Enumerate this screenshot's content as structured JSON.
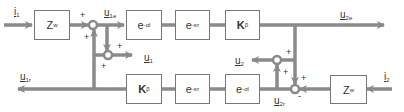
{
  "diagram": {
    "type": "block-diagram",
    "line_color": "#8a8a8a",
    "blocks": {
      "zw_top": {
        "base": "Z",
        "sub": "w"
      },
      "eal_top": {
        "base": "e",
        "sup": "-αl"
      },
      "est_top": {
        "base": "e",
        "sup": "-sτ"
      },
      "kb_top": {
        "base": "K",
        "sub": "β"
      },
      "kb_bot": {
        "base": "K",
        "sub": "β"
      },
      "est_bot": {
        "base": "e",
        "sup": "-sτ"
      },
      "eal_bot": {
        "base": "e",
        "sup": "-αl"
      },
      "zw_bot": {
        "base": "Z",
        "sub": "w"
      }
    },
    "signals": {
      "i1": {
        "base": "i",
        "sub": "1"
      },
      "u1e": {
        "base": "u",
        "sub": "1e"
      },
      "u1": {
        "base": "u",
        "sub": "1"
      },
      "u1r": {
        "base": "u",
        "sub": "1r"
      },
      "u2e": {
        "base": "u",
        "sub": "2e"
      },
      "u2": {
        "base": "u",
        "sub": "2"
      },
      "u2r": {
        "base": "u",
        "sub": "2r"
      },
      "i2": {
        "base": "i",
        "sub": "2"
      }
    },
    "signs": {
      "plus": "+",
      "minus": "-"
    }
  }
}
